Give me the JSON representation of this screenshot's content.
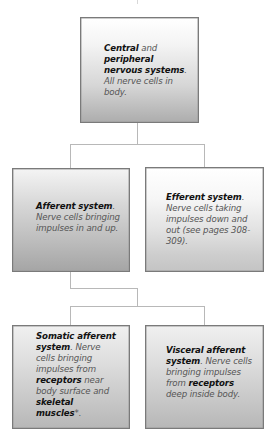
{
  "diagram": {
    "type": "hierarchy",
    "colors": {
      "border": "#7a7a7a",
      "connector": "#b8b8b8",
      "heading_text": "#111111",
      "body_text": "#555555"
    },
    "root": {
      "bold1": "Central",
      "plain1": " and ",
      "bold2": "peripheral nervous systems",
      "plain2": ". All nerve cells in body."
    },
    "level2": {
      "afferent": {
        "bold1": "Afferent system",
        "plain1": ". Nerve cells bringing impulses in and up."
      },
      "efferent": {
        "bold1": "Efferent system",
        "plain1": ". Nerve cells taking impulses down and out (see pages 308-309)."
      }
    },
    "level3": {
      "somatic": {
        "bold1": "Somatic afferent system",
        "plain1": ". Nerve cells bringing impulses from ",
        "bold2": "receptors",
        "plain2": " near body surface and ",
        "bold3": "skeletal muscles",
        "plain3": "*."
      },
      "visceral": {
        "bold1": "Visceral afferent system",
        "plain1": ". Nerve cells bringing impulses from ",
        "bold2": "receptors",
        "plain2": " deep inside body."
      }
    },
    "edges": [
      [
        "Central and peripheral nervous systems",
        "Afferent system"
      ],
      [
        "Central and peripheral nervous systems",
        "Efferent system"
      ],
      [
        "Afferent system",
        "Somatic afferent system"
      ],
      [
        "Afferent system",
        "Visceral afferent system"
      ]
    ]
  }
}
